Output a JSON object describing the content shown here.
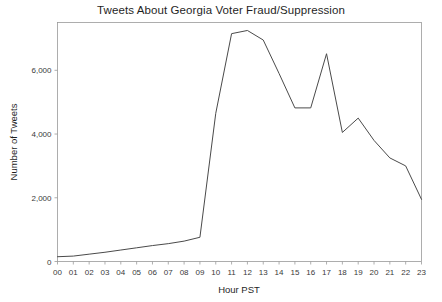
{
  "chart_data": {
    "type": "line",
    "title": "Tweets About Georgia Voter Fraud/Suppression",
    "xlabel": "Hour PST",
    "ylabel": "Number of Tweets",
    "x": [
      "00",
      "01",
      "02",
      "03",
      "04",
      "05",
      "06",
      "07",
      "08",
      "09",
      "10",
      "11",
      "12",
      "13",
      "14",
      "15",
      "16",
      "17",
      "18",
      "19",
      "20",
      "21",
      "22",
      "23"
    ],
    "categories": [
      "00",
      "01",
      "02",
      "03",
      "04",
      "05",
      "06",
      "07",
      "08",
      "09",
      "10",
      "11",
      "12",
      "13",
      "14",
      "15",
      "16",
      "17",
      "18",
      "19",
      "20",
      "21",
      "22",
      "23"
    ],
    "values": [
      150,
      170,
      230,
      290,
      360,
      430,
      500,
      560,
      640,
      760,
      4650,
      7150,
      7250,
      6950,
      5900,
      4820,
      4820,
      6520,
      4050,
      4500,
      3800,
      3250,
      3000,
      1950
    ],
    "series": [
      {
        "name": "Tweets",
        "values": [
          150,
          170,
          230,
          290,
          360,
          430,
          500,
          560,
          640,
          760,
          4650,
          7150,
          7250,
          6950,
          5900,
          4820,
          4820,
          6520,
          4050,
          4500,
          3800,
          3250,
          3000,
          1950
        ]
      }
    ],
    "ylim": [
      0,
      7500
    ],
    "xlim": [
      0,
      23
    ],
    "yticks": [
      0,
      2000,
      4000,
      6000
    ],
    "ytick_labels": [
      "0",
      "2,000",
      "4,000",
      "6,000"
    ],
    "xtick_labels": [
      "00",
      "01",
      "02",
      "03",
      "04",
      "05",
      "06",
      "07",
      "08",
      "09",
      "10",
      "11",
      "12",
      "13",
      "14",
      "15",
      "16",
      "17",
      "18",
      "19",
      "20",
      "21",
      "22",
      "23"
    ],
    "grid": false,
    "legend": false,
    "legend_position": "none",
    "line_color": "#4a4a4a",
    "background_color": "#ffffff",
    "frame_color": "#9a9a9a"
  }
}
